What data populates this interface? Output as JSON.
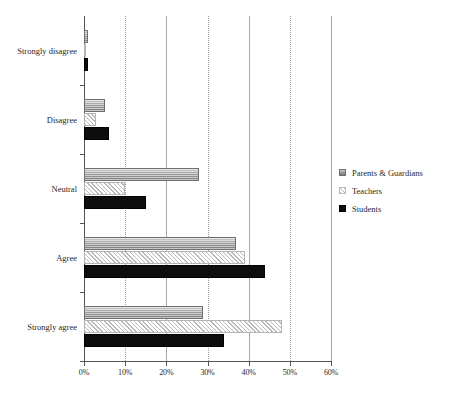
{
  "chart_data": {
    "type": "bar",
    "orientation": "horizontal",
    "title": "",
    "subtitle": "",
    "xlabel": "",
    "ylabel": "",
    "categories": [
      "Strongly disagree",
      "Disagree",
      "Neutral",
      "Agree",
      "Strongly agree"
    ],
    "series": [
      {
        "name": "Parents & Guardians",
        "values": [
          1,
          5,
          28,
          37,
          29
        ]
      },
      {
        "name": "Teachers",
        "values": [
          0.3,
          3,
          10,
          39,
          48
        ]
      },
      {
        "name": "Students",
        "values": [
          1,
          6,
          15,
          44,
          34
        ]
      }
    ],
    "xlim": [
      0,
      60
    ],
    "xticks": [
      0,
      10,
      20,
      30,
      40,
      50,
      60
    ],
    "xtick_labels": [
      "0%",
      "10%",
      "20%",
      "30%",
      "40%",
      "50%",
      "60%"
    ],
    "grid": true,
    "grid_axis": "x",
    "legend_position": "right",
    "legend_entries": [
      "Parents & Guardians",
      "Teachers",
      "Students"
    ],
    "annotations": []
  },
  "colors": {
    "parents": "#9d9d9d",
    "teachers": "#b9b9b9",
    "students": "#0d0d0d",
    "axis": "#555555",
    "grid": "#a8a8a8",
    "text": "#1f1f1f",
    "background": "#ffffff"
  }
}
